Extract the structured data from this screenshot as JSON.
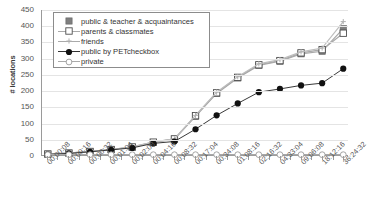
{
  "chart_data": {
    "type": "line",
    "title": "",
    "xlabel": "",
    "ylabel": "# locations",
    "ylim": [
      0,
      450
    ],
    "ytick_step": 50,
    "yticks": [
      "450",
      "400",
      "350",
      "300",
      "250",
      "200",
      "150",
      "100",
      "50",
      "0"
    ],
    "grid": true,
    "legend_position": "top-left",
    "categories": [
      "00:00:08",
      "00:00:16",
      "00:00:32",
      "00:01:04",
      "00:02:08",
      "00:04:16",
      "00:08:32",
      "00:17:04",
      "00:34:08",
      "01:08:16",
      "02:16:32",
      "04:33:04",
      "09:06:08",
      "18:12:16",
      "36:24:32"
    ],
    "series": [
      {
        "name": "public & teacher & acquaintances",
        "marker": "filled-square",
        "color": "#7f7f7f",
        "values": [
          3,
          6,
          11,
          17,
          24,
          39,
          49,
          120,
          191,
          239,
          278,
          291,
          314,
          322,
          392
        ]
      },
      {
        "name": "parents & classmates",
        "marker": "open-square",
        "color": "#8c8c8c",
        "values": [
          3,
          6,
          11,
          17,
          25,
          40,
          50,
          122,
          193,
          241,
          280,
          293,
          317,
          327,
          378
        ]
      },
      {
        "name": "friends",
        "marker": "cross",
        "color": "#b0b0b0",
        "values": [
          3,
          6,
          11,
          17,
          25,
          40,
          50,
          123,
          195,
          243,
          283,
          296,
          320,
          332,
          414
        ]
      },
      {
        "name": "public by PETcheckbox",
        "marker": "filled-circle",
        "color": "#111111",
        "values": [
          2,
          5,
          10,
          16,
          22,
          36,
          42,
          80,
          123,
          160,
          195,
          205,
          216,
          223,
          268
        ]
      },
      {
        "name": "private",
        "marker": "open-circle",
        "color": "#9a9a9a",
        "values": [
          1,
          1,
          1,
          1,
          1,
          1,
          1,
          1,
          1,
          1,
          1,
          1,
          1,
          1,
          1
        ]
      }
    ],
    "extra_points": {
      "public_teacher_last": 397,
      "parents_last": 392,
      "friends_last": 414,
      "petcheckbox_last": 273
    }
  }
}
